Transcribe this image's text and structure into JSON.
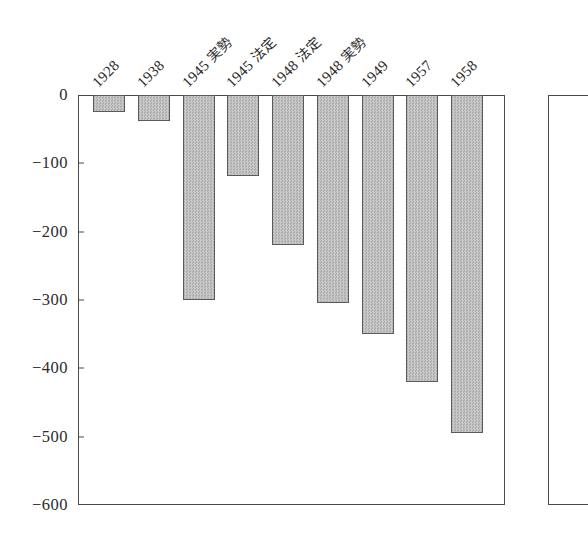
{
  "chart_data": {
    "type": "bar",
    "title": "",
    "subtitle": "",
    "xlabel": "",
    "ylabel": "",
    "categories": [
      "1928",
      "1938",
      "1945 実勢",
      "1945 法定",
      "1948 法定",
      "1948 実勢",
      "1949",
      "1957",
      "1958"
    ],
    "values": [
      -25,
      -38,
      -300,
      -119,
      -220,
      -305,
      -350,
      -420,
      -495
    ],
    "series": [
      {
        "name": "",
        "values": [
          -25,
          -38,
          -300,
          -119,
          -220,
          -305,
          -350,
          -420,
          -495
        ]
      }
    ],
    "ylim": [
      -600,
      0
    ],
    "yticks": [
      0,
      -100,
      -200,
      -300,
      -400,
      -500,
      -600
    ],
    "ytick_labels": [
      "0",
      "−100",
      "−200",
      "−300",
      "−400",
      "−500",
      "−600"
    ],
    "grid": false,
    "legend": null,
    "legend_position": "none",
    "bar_fill_color": "#bdbdbd",
    "bar_edge_color": "#5a5a5a",
    "axis_color": "#4a4a4a",
    "background_color": "#ffffff",
    "xtick_label_rotation": 45,
    "panels": 2
  }
}
